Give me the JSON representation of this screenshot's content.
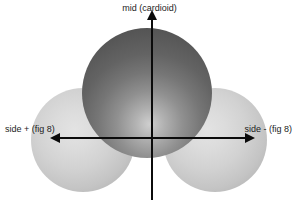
{
  "figure": {
    "background_color": "#ffffff"
  },
  "labels": {
    "mid": "mid (cardioid)",
    "side_plus": "side + (fig 8)",
    "side_minus": "side - (fig 8)"
  },
  "lobes": [
    {
      "name": "mid",
      "label": "mid (cardioid)",
      "shape": "sphere",
      "fill": "dark-gray-radial-gradient",
      "color": "#636363",
      "position": "center-top"
    },
    {
      "name": "side-plus",
      "label": "side + (fig 8)",
      "shape": "sphere",
      "fill": "light-gray-radial-gradient",
      "color": "#d2d2d2",
      "position": "left"
    },
    {
      "name": "side-minus",
      "label": "side - (fig 8)",
      "shape": "sphere",
      "fill": "light-gray-radial-gradient",
      "color": "#d2d2d2",
      "position": "right"
    }
  ],
  "axes": {
    "vertical": {
      "name": "mid-axis",
      "direction": "up",
      "arrowheads": 1,
      "color": "#0b0b0b"
    },
    "horizontal": {
      "name": "side-axis",
      "direction": "both",
      "arrowheads": 2,
      "color": "#0b0b0b"
    }
  }
}
